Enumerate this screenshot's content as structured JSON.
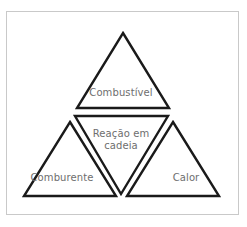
{
  "figure": {
    "background_color": "#ffffff",
    "frame_border_color": "#c9c9c9",
    "stroke_color": "#1a1a1a",
    "label_color": "#6e6e6e",
    "labels": {
      "fuel": "Combustível",
      "oxidizer": "Comburente",
      "heat": "Calor",
      "chain_reaction": "Reação em\ncadeia",
      "chain_reaction_line1": "Reação em",
      "chain_reaction_line2": "cadeia"
    }
  }
}
